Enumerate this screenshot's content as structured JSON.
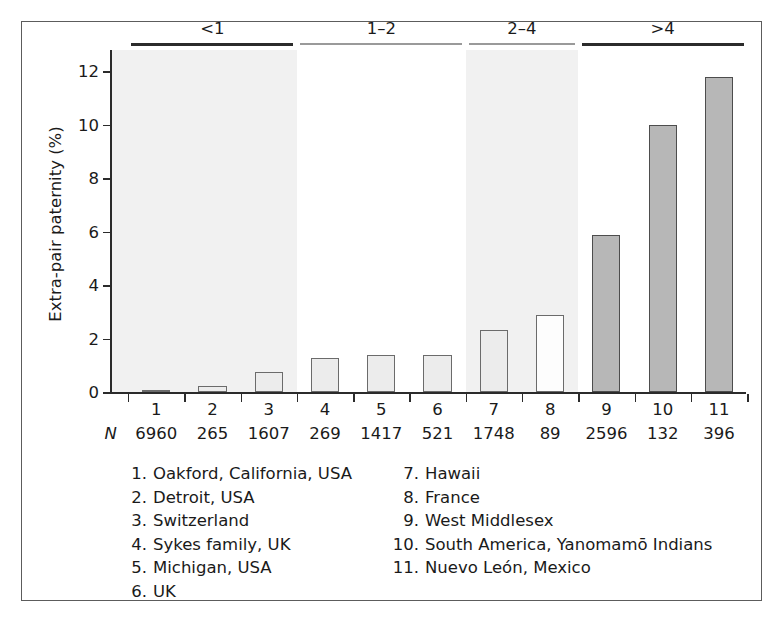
{
  "chart_data": {
    "type": "bar",
    "title": "",
    "xlabel": "",
    "ylabel": "Extra-pair paternity (%)",
    "ylim": [
      0,
      12.8
    ],
    "yticks": [
      0,
      2,
      4,
      6,
      8,
      10,
      12
    ],
    "ytick_labels": [
      "0",
      "2",
      "4",
      "6",
      "8",
      "10",
      "12"
    ],
    "grid": false,
    "legend_position": "below-axes",
    "categories": [
      "1",
      "2",
      "3",
      "4",
      "5",
      "6",
      "7",
      "8",
      "9",
      "10",
      "11"
    ],
    "values": [
      0.1,
      0.25,
      0.75,
      1.3,
      1.4,
      1.4,
      2.35,
      2.9,
      5.9,
      10.0,
      11.8
    ],
    "n_label": "N",
    "n_values": [
      "6960",
      "265",
      "1607",
      "269",
      "1417",
      "521",
      "1748",
      "89",
      "2596",
      "132",
      "396"
    ],
    "bar_shades": [
      "light",
      "light",
      "light",
      "light",
      "light",
      "light",
      "light",
      "white",
      "dark",
      "dark",
      "dark"
    ],
    "groups": [
      {
        "label": "<1",
        "bars": [
          1,
          2,
          3
        ],
        "line_style": "thick",
        "shaded": true
      },
      {
        "label": "1–2",
        "bars": [
          4,
          5,
          6
        ],
        "line_style": "thin",
        "shaded": false
      },
      {
        "label": "2–4",
        "bars": [
          7,
          8
        ],
        "line_style": "thin",
        "shaded": true
      },
      {
        "label": ">4",
        "bars": [
          9,
          10,
          11
        ],
        "line_style": "thick",
        "shaded": false
      }
    ],
    "annotations": [
      {
        "text": "<1",
        "kind": "group-header"
      },
      {
        "text": "1–2",
        "kind": "group-header"
      },
      {
        "text": "2–4",
        "kind": "group-header"
      },
      {
        "text": ">4",
        "kind": "group-header"
      }
    ]
  },
  "legend": {
    "left_column": [
      {
        "num": "1.",
        "text": "Oakford, California, USA"
      },
      {
        "num": "2.",
        "text": "Detroit, USA"
      },
      {
        "num": "3.",
        "text": "Switzerland"
      },
      {
        "num": "4.",
        "text": "Sykes family, UK"
      },
      {
        "num": "5.",
        "text": "Michigan, USA"
      },
      {
        "num": "6.",
        "text": "UK"
      }
    ],
    "right_column": [
      {
        "num": "7.",
        "text": "Hawaii"
      },
      {
        "num": "8.",
        "text": "France"
      },
      {
        "num": "9.",
        "text": "West Middlesex"
      },
      {
        "num": "10.",
        "text": "South America, Yanomamō Indians"
      },
      {
        "num": "11.",
        "text": "Nuevo León, Mexico"
      }
    ]
  },
  "colors": {
    "frame_border": "#5c5c5c",
    "band_shaded": "#f1f1f1",
    "band_plain": "#ffffff",
    "bar_light": "#ececec",
    "bar_white": "#fdfdfd",
    "bar_dark": "#b7b7b7",
    "axis": "#2b2b2b",
    "text": "#1a1a1a"
  }
}
